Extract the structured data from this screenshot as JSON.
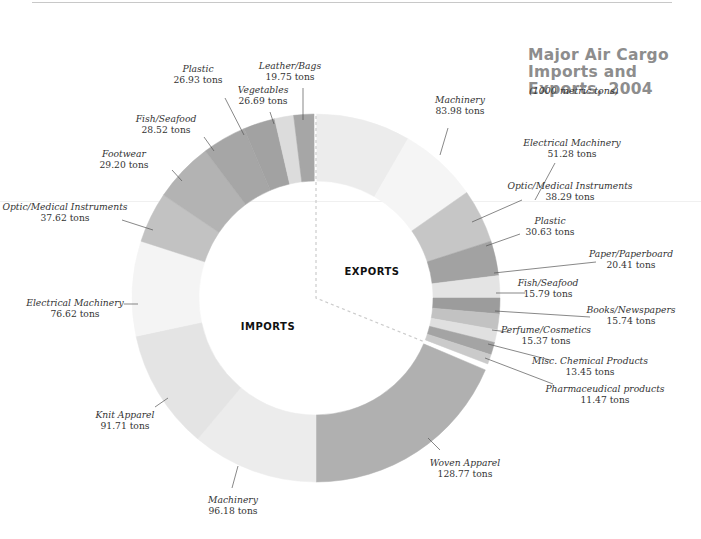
{
  "header": {
    "title_line1": "Major Air Cargo",
    "title_line2": "Imports and Exports, 2004",
    "subtitle": "(1000 metric tons)"
  },
  "chart_data": {
    "type": "pie",
    "variant": "donut",
    "title": "Major Air Cargo Imports and Exports, 2004",
    "subtitle": "(1000 metric tons)",
    "unit": "tons",
    "groups": [
      {
        "name": "EXPORTS",
        "categories": [
          "Machinery",
          "Electrical Machinery",
          "Optic/Medical Instruments",
          "Plastic",
          "Paper/Paperboard",
          "Fish/Seafood",
          "Books/Newspapers",
          "Perfume/Cosmetics",
          "Misc. Chemical Products",
          "Pharmaceudical products"
        ],
        "values": [
          83.98,
          51.28,
          38.29,
          30.63,
          20.41,
          15.79,
          15.74,
          15.37,
          13.45,
          11.47
        ]
      },
      {
        "name": "IMPORTS",
        "categories": [
          "Woven Apparel",
          "Machinery",
          "Knit Apparel",
          "Electrical Machinery",
          "Optic/Medical Instruments",
          "Footwear",
          "Fish/Seafood",
          "Plastic",
          "Vegetables",
          "Leather/Bags"
        ],
        "values": [
          128.77,
          96.18,
          91.71,
          76.62,
          37.62,
          29.2,
          28.52,
          26.93,
          26.69,
          19.75
        ]
      }
    ],
    "legend": "none (direct labels)"
  },
  "geometry": {
    "cx": 316,
    "cy": 298,
    "r_outer": 184,
    "r_inner": 117,
    "segments": [
      {
        "group": "exports",
        "label": "Machinery",
        "value": "83.98 tons",
        "a0": 90,
        "a1": 60,
        "color": "#ececec",
        "tx": 460,
        "ty": 103,
        "anchor": "middle",
        "lx1": 448,
        "ly1": 128,
        "lx2": 440,
        "ly2": 155
      },
      {
        "group": "exports",
        "label": "Electrical Machinery",
        "value": "51.28 tons",
        "a0": 60,
        "a1": 35,
        "color": "#f5f5f5",
        "tx": 572,
        "ty": 146,
        "anchor": "middle",
        "lx1": 555,
        "ly1": 163,
        "lx2": 535,
        "ly2": 200
      },
      {
        "group": "exports",
        "label": "Optic/Medical Instruments",
        "value": "38.29 tons",
        "a0": 35,
        "a1": 18,
        "color": "#c6c6c6",
        "tx": 570,
        "ty": 189,
        "anchor": "middle",
        "lx1": 522,
        "ly1": 200,
        "lx2": 472,
        "ly2": 222
      },
      {
        "group": "exports",
        "label": "Plastic",
        "value": "30.63 tons",
        "a0": 18,
        "a1": 7,
        "color": "#a2a2a2",
        "tx": 550,
        "ty": 224,
        "anchor": "middle",
        "lx1": 520,
        "ly1": 234,
        "lx2": 486,
        "ly2": 246
      },
      {
        "group": "exports",
        "label": "Paper/Paperboard",
        "value": "20.41 tons",
        "a0": 7,
        "a1": 0,
        "color": "#e4e4e4",
        "tx": 631,
        "ty": 257,
        "anchor": "middle",
        "lx1": 596,
        "ly1": 262,
        "lx2": 494,
        "ly2": 273
      },
      {
        "group": "exports",
        "label": "Fish/Seafood",
        "value": "15.79 tons",
        "a0": 0,
        "a1": -5,
        "color": "#9c9c9c",
        "tx": 548,
        "ty": 286,
        "anchor": "middle",
        "lx1": 525,
        "ly1": 293,
        "lx2": 496,
        "ly2": 293
      },
      {
        "group": "exports",
        "label": "Books/Newspapers",
        "value": "15.74 tons",
        "a0": -5,
        "a1": -10,
        "color": "#c2c2c2",
        "tx": 631,
        "ty": 313,
        "anchor": "middle",
        "lx1": 590,
        "ly1": 317,
        "lx2": 495,
        "ly2": 311
      },
      {
        "group": "exports",
        "label": "Perfume/Cosmetics",
        "value": "15.37 tons",
        "a0": -10,
        "a1": -14,
        "color": "#e0e0e0",
        "tx": 546,
        "ty": 333,
        "anchor": "middle",
        "lx1": 508,
        "ly1": 332,
        "lx2": 492,
        "ly2": 330
      },
      {
        "group": "exports",
        "label": "Misc. Chemical Products",
        "value": "13.45 tons",
        "a0": -14,
        "a1": -18,
        "color": "#a4a4a4",
        "tx": 590,
        "ty": 364,
        "anchor": "middle",
        "lx1": 550,
        "ly1": 360,
        "lx2": 488,
        "ly2": 344
      },
      {
        "group": "exports",
        "label": "Pharmaceudical products",
        "value": "11.47 tons",
        "a0": -18,
        "a1": -21,
        "color": "#cacaca",
        "tx": 605,
        "ty": 392,
        "anchor": "middle",
        "lx1": 553,
        "ly1": 384,
        "lx2": 485,
        "ly2": 358
      },
      {
        "group": "imports",
        "label": "Woven Apparel",
        "value": "128.77 tons",
        "a0": -23,
        "a1": -90,
        "color": "#b0b0b0",
        "tx": 465,
        "ty": 466,
        "anchor": "middle",
        "lx1": 440,
        "ly1": 450,
        "lx2": 428,
        "ly2": 438
      },
      {
        "group": "imports",
        "label": "Machinery",
        "value": "96.18 tons",
        "a0": -90,
        "a1": -130,
        "color": "#ececec",
        "tx": 233,
        "ty": 503,
        "anchor": "middle",
        "lx1": 232,
        "ly1": 488,
        "lx2": 238,
        "ly2": 466
      },
      {
        "group": "imports",
        "label": "Knit Apparel",
        "value": "91.71 tons",
        "a0": -130,
        "a1": -168,
        "color": "#e4e4e4",
        "tx": 125,
        "ty": 418,
        "anchor": "middle",
        "lx1": 155,
        "ly1": 407,
        "lx2": 168,
        "ly2": 398
      },
      {
        "group": "imports",
        "label": "Electrical Machinery",
        "value": "76.62 tons",
        "a0": -168,
        "a1": 162,
        "color": "#f4f4f4",
        "tx": 75,
        "ty": 306,
        "anchor": "middle",
        "lx1": 124,
        "ly1": 304,
        "lx2": 138,
        "ly2": 304
      },
      {
        "group": "imports",
        "label": "Optic/Medical Instruments",
        "value": "37.62 tons",
        "a0": 162,
        "a1": 146,
        "color": "#c2c2c2",
        "tx": 65,
        "ty": 210,
        "anchor": "middle",
        "lx1": 122,
        "ly1": 220,
        "lx2": 153,
        "ly2": 230
      },
      {
        "group": "imports",
        "label": "Footwear",
        "value": "29.20 tons",
        "a0": 146,
        "a1": 127,
        "color": "#b3b3b3",
        "tx": 124,
        "ty": 157,
        "anchor": "middle",
        "lx1": 172,
        "ly1": 170,
        "lx2": 182,
        "ly2": 181
      },
      {
        "group": "imports",
        "label": "Fish/Seafood",
        "value": "28.52 tons",
        "a0": 127,
        "a1": 113,
        "color": "#a6a6a6",
        "tx": 166,
        "ty": 122,
        "anchor": "middle",
        "lx1": 204,
        "ly1": 137,
        "lx2": 214,
        "ly2": 151
      },
      {
        "group": "imports",
        "label": "Plastic",
        "value": "26.93 tons",
        "a0": 113,
        "a1": 103,
        "color": "#a2a2a2",
        "tx": 198,
        "ty": 72,
        "anchor": "middle",
        "lx1": 225,
        "ly1": 98,
        "lx2": 244,
        "ly2": 135
      },
      {
        "group": "imports",
        "label": "Vegetables",
        "value": "26.69 tons",
        "a0": 103,
        "a1": 97,
        "color": "#dcdcdc",
        "tx": 263,
        "ty": 93,
        "anchor": "middle",
        "lx1": 270,
        "ly1": 112,
        "lx2": 274,
        "ly2": 124
      },
      {
        "group": "imports",
        "label": "Leather/Bags",
        "value": "19.75 tons",
        "a0": 97,
        "a1": 90.5,
        "color": "#a6a6a6",
        "tx": 290,
        "ty": 69,
        "anchor": "middle",
        "lx1": 303,
        "ly1": 88,
        "lx2": 303,
        "ly2": 120
      }
    ],
    "group_labels": [
      {
        "text": "EXPORTS",
        "x": 372,
        "y": 275
      },
      {
        "text": "IMPORTS",
        "x": 268,
        "y": 330
      }
    ],
    "divider_color": "#cccccc"
  }
}
